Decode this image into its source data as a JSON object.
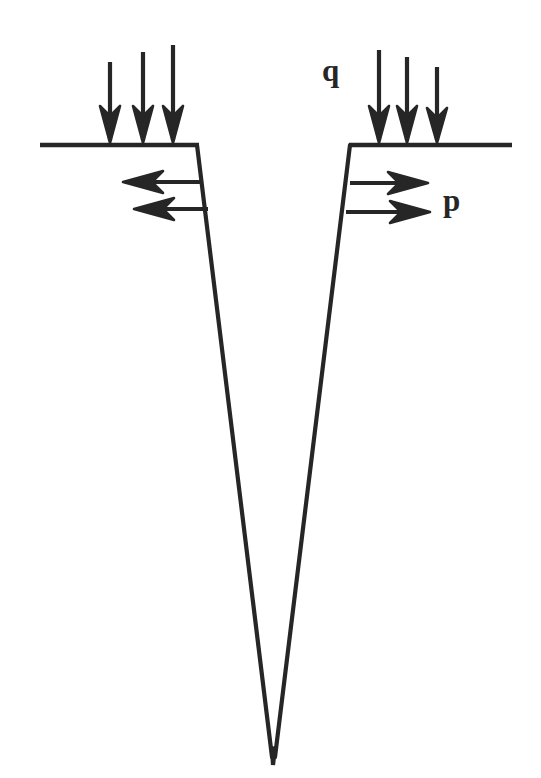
{
  "diagram": {
    "background_color": "#ffffff",
    "ink_color": "#262626",
    "stroke_width": 4.2,
    "canvas": {
      "width": 541,
      "height": 778
    },
    "labels": [
      {
        "id": "q",
        "text": "q",
        "x": 322,
        "y": 55,
        "meaning": "vertical surcharge load"
      },
      {
        "id": "p",
        "text": "p",
        "x": 443,
        "y": 185,
        "meaning": "lateral pressure on wedge face"
      }
    ],
    "ground_lines": [
      {
        "id": "ground-line-left",
        "x1": 40,
        "y1": 145,
        "x2": 198,
        "y2": 145
      },
      {
        "id": "ground-line-right",
        "x1": 350,
        "y1": 145,
        "x2": 512,
        "y2": 145
      }
    ],
    "wedge": {
      "apex": {
        "x": 273,
        "y": 760
      },
      "left_wall": {
        "x1": 197,
        "y1": 145,
        "x2": 273,
        "y2": 760
      },
      "right_wall": {
        "x1": 350,
        "y1": 145,
        "x2": 273,
        "y2": 760
      },
      "top_width": 153,
      "depth": 615
    },
    "vertical_arrows": {
      "group_left": {
        "direction": "down",
        "count": 3,
        "tip_y": 143,
        "arrows": [
          {
            "x": 110,
            "top_y": 62
          },
          {
            "x": 143,
            "top_y": 52
          },
          {
            "x": 173,
            "top_y": 45
          }
        ]
      },
      "group_right": {
        "direction": "down",
        "count": 3,
        "tip_y": 143,
        "label": "q",
        "arrows": [
          {
            "x": 379,
            "top_y": 50
          },
          {
            "x": 407,
            "top_y": 57
          },
          {
            "x": 437,
            "top_y": 67
          }
        ]
      }
    },
    "horizontal_arrows": {
      "group_left": {
        "direction": "left",
        "count": 2,
        "arrows": [
          {
            "tail_x": 203,
            "tip_x": 123,
            "y": 182
          },
          {
            "tail_x": 208,
            "tip_x": 134,
            "y": 209
          }
        ]
      },
      "group_right": {
        "direction": "right",
        "count": 2,
        "label": "p",
        "arrows": [
          {
            "tail_x": 350,
            "tip_x": 428,
            "y": 183
          },
          {
            "tail_x": 346,
            "tip_x": 430,
            "y": 212
          }
        ]
      }
    }
  }
}
